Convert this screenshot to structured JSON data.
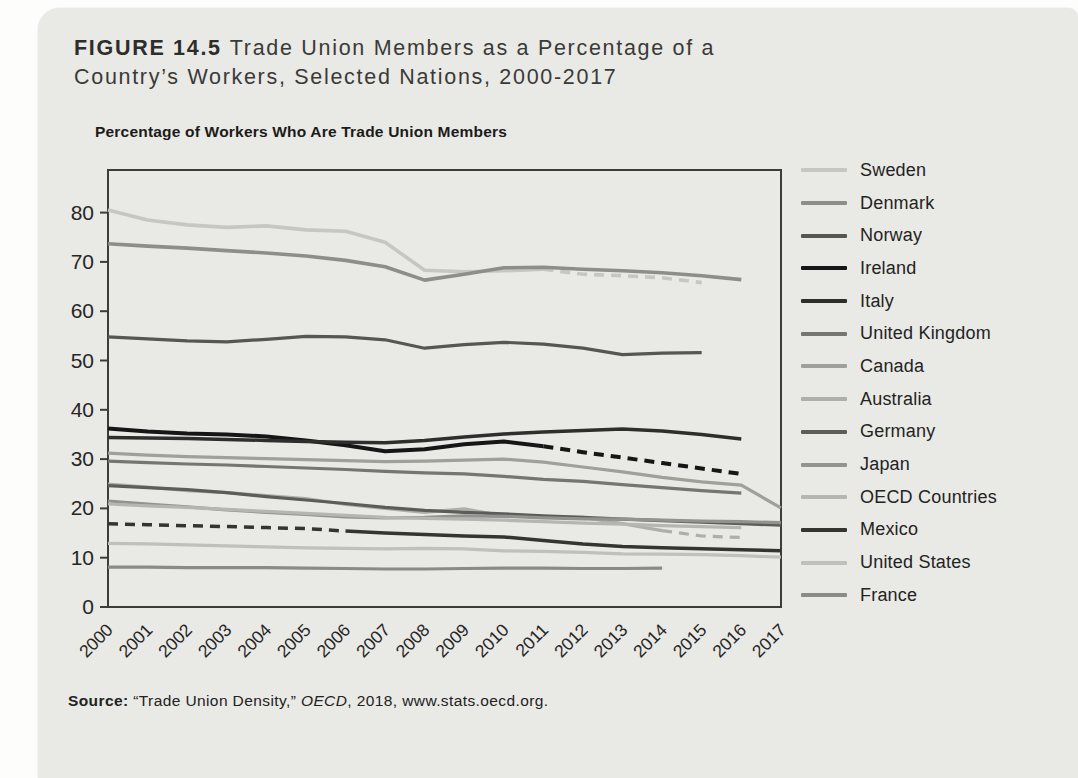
{
  "figure": {
    "label": "FIGURE 14.5",
    "title_line1": "Trade Union Members as a Percentage of a",
    "title_line2": "Country’s Workers, Selected Nations, 2000-2017",
    "source": {
      "prefix": "Source:",
      "work": " “Trade Union Density,” ",
      "publisher": "OECD",
      "tail": ", 2018, www.stats.oecd.org."
    }
  },
  "chart_data": {
    "type": "line",
    "title": "Percentage of Workers Who Are Trade Union Members",
    "xlabel": "",
    "ylabel": "",
    "x": [
      2000,
      2001,
      2002,
      2003,
      2004,
      2005,
      2006,
      2007,
      2008,
      2009,
      2010,
      2011,
      2012,
      2013,
      2014,
      2015,
      2016,
      2017
    ],
    "ylim": [
      0,
      88
    ],
    "yticks": [
      0,
      10,
      20,
      30,
      40,
      50,
      60,
      70,
      80
    ],
    "grid": false,
    "legend_position": "right",
    "dashed_note": "dashed segments indicate estimated values",
    "series": [
      {
        "name": "Sweden",
        "color": "#c6c6c3",
        "width": 3.6,
        "dash": {
          "mode": "end",
          "year": 2011
        },
        "values": [
          80.5,
          78.5,
          77.5,
          77.0,
          77.3,
          76.5,
          76.2,
          74.0,
          68.3,
          68.0,
          68.2,
          68.5,
          67.5,
          67.2,
          66.8,
          65.8,
          null,
          null
        ]
      },
      {
        "name": "Denmark",
        "color": "#8d8d8a",
        "width": 3.6,
        "dash": null,
        "values": [
          73.7,
          73.2,
          72.8,
          72.3,
          71.8,
          71.2,
          70.3,
          69.0,
          66.3,
          67.5,
          68.8,
          68.9,
          68.5,
          68.2,
          67.8,
          67.2,
          66.4,
          null
        ]
      },
      {
        "name": "Norway",
        "color": "#565654",
        "width": 3.2,
        "dash": null,
        "values": [
          54.8,
          54.4,
          54.0,
          53.8,
          54.3,
          54.9,
          54.8,
          54.2,
          52.5,
          53.2,
          53.7,
          53.3,
          52.5,
          51.2,
          51.5,
          51.6,
          null,
          null
        ]
      },
      {
        "name": "Ireland",
        "color": "#161616",
        "width": 4.0,
        "dash": {
          "mode": "end",
          "year": 2011
        },
        "values": [
          36.2,
          35.6,
          35.2,
          35.0,
          34.6,
          33.8,
          32.8,
          31.6,
          32.0,
          33.0,
          33.6,
          32.6,
          31.4,
          30.3,
          29.2,
          28.1,
          27.0,
          null
        ]
      },
      {
        "name": "Italy",
        "color": "#2e2e2c",
        "width": 3.5,
        "dash": null,
        "values": [
          34.4,
          34.3,
          34.2,
          34.0,
          33.8,
          33.6,
          33.4,
          33.3,
          33.8,
          34.5,
          35.1,
          35.5,
          35.8,
          36.1,
          35.7,
          35.0,
          34.1,
          null
        ]
      },
      {
        "name": "United Kingdom",
        "color": "#757573",
        "width": 3.2,
        "dash": null,
        "values": [
          29.6,
          29.3,
          29.0,
          28.8,
          28.5,
          28.2,
          27.9,
          27.5,
          27.2,
          27.0,
          26.5,
          25.9,
          25.5,
          24.8,
          24.2,
          23.6,
          23.1,
          null
        ]
      },
      {
        "name": "Canada",
        "color": "#9f9f9c",
        "width": 3.2,
        "dash": null,
        "values": [
          31.2,
          30.8,
          30.5,
          30.3,
          30.1,
          29.9,
          29.7,
          29.5,
          29.6,
          29.8,
          30.0,
          29.4,
          28.4,
          27.4,
          26.3,
          25.4,
          24.7,
          20.1
        ]
      },
      {
        "name": "Australia",
        "color": "#aeaeab",
        "width": 3.2,
        "dash": {
          "mode": "end",
          "year": 2014
        },
        "values": [
          24.9,
          24.3,
          23.6,
          23.2,
          22.6,
          22.0,
          20.8,
          20.0,
          19.2,
          19.9,
          18.5,
          18.3,
          18.2,
          16.9,
          15.5,
          14.4,
          14.1,
          null
        ]
      },
      {
        "name": "Germany",
        "color": "#5c5c5a",
        "width": 3.2,
        "dash": null,
        "values": [
          24.6,
          24.2,
          23.8,
          23.2,
          22.4,
          21.7,
          21.0,
          20.2,
          19.6,
          19.2,
          18.9,
          18.5,
          18.2,
          17.8,
          17.5,
          17.2,
          16.9,
          16.6
        ]
      },
      {
        "name": "Japan",
        "color": "#929290",
        "width": 3.2,
        "dash": null,
        "values": [
          21.5,
          20.9,
          20.3,
          19.7,
          19.2,
          18.8,
          18.3,
          18.1,
          18.2,
          18.5,
          18.4,
          18.1,
          17.9,
          17.8,
          17.6,
          17.4,
          17.3,
          17.1
        ]
      },
      {
        "name": "OECD Countries",
        "color": "#b5b5b2",
        "width": 3.2,
        "dash": null,
        "values": [
          20.9,
          20.5,
          20.2,
          19.8,
          19.4,
          19.0,
          18.6,
          18.2,
          18.0,
          17.8,
          17.6,
          17.3,
          17.0,
          16.8,
          16.5,
          16.3,
          16.1,
          null
        ]
      },
      {
        "name": "Mexico",
        "color": "#343432",
        "width": 3.5,
        "dash": {
          "mode": "start",
          "year": 2006
        },
        "values": [
          16.9,
          16.7,
          16.5,
          16.3,
          16.1,
          15.9,
          15.4,
          15.0,
          14.7,
          14.4,
          14.2,
          13.5,
          12.8,
          12.3,
          12.0,
          11.8,
          11.6,
          11.4
        ]
      },
      {
        "name": "United States",
        "color": "#bfbfbc",
        "width": 3.2,
        "dash": null,
        "values": [
          12.9,
          12.8,
          12.6,
          12.4,
          12.2,
          12.0,
          11.9,
          11.8,
          11.9,
          11.8,
          11.4,
          11.3,
          11.1,
          10.8,
          10.7,
          10.6,
          10.4,
          10.1
        ]
      },
      {
        "name": "France",
        "color": "#8a8a88",
        "width": 3.2,
        "dash": null,
        "values": [
          8.1,
          8.1,
          8.0,
          8.0,
          8.0,
          7.9,
          7.8,
          7.7,
          7.7,
          7.8,
          7.9,
          7.9,
          7.8,
          7.8,
          7.9,
          null,
          null,
          null
        ]
      }
    ]
  }
}
